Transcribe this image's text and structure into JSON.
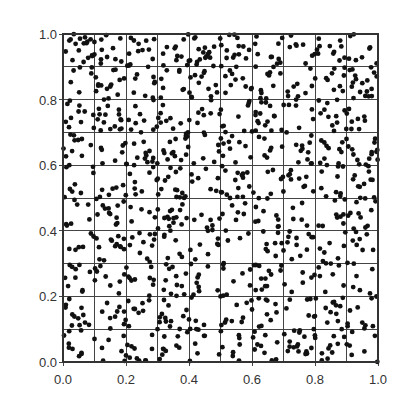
{
  "chart_data": {
    "type": "scatter",
    "title": "",
    "xlabel": "",
    "ylabel": "",
    "xlim": [
      0.0,
      1.0
    ],
    "ylim": [
      0.0,
      1.0
    ],
    "x_ticks": [
      "0.0",
      "0.2",
      "0.4",
      "0.6",
      "0.8",
      "1.0"
    ],
    "y_ticks": [
      "0.0",
      "0.2",
      "0.4",
      "0.6",
      "0.8",
      "1.0"
    ],
    "grid": true,
    "grid_divisions": 10,
    "legend": null,
    "approx_point_count": 1000,
    "marker_color": "#111111",
    "series": [
      {
        "name": "points",
        "points_note": "representative sample of the ~1000 uniformly scattered points",
        "x": [
          0.02,
          0.04,
          0.05,
          0.03,
          0.07,
          0.09,
          0.12,
          0.14,
          0.16,
          0.15,
          0.18,
          0.13,
          0.21,
          0.24,
          0.27,
          0.29,
          0.33,
          0.36,
          0.38,
          0.42,
          0.44,
          0.47,
          0.52,
          0.55,
          0.58,
          0.61,
          0.63,
          0.66,
          0.69,
          0.72,
          0.74,
          0.77,
          0.81,
          0.84,
          0.86,
          0.88,
          0.91,
          0.93,
          0.95,
          0.97,
          0.02,
          0.06,
          0.11,
          0.15,
          0.19,
          0.23,
          0.26,
          0.31,
          0.35,
          0.39,
          0.43,
          0.48,
          0.51,
          0.56,
          0.59,
          0.64,
          0.67,
          0.71,
          0.76,
          0.79,
          0.83,
          0.87,
          0.9,
          0.94,
          0.98,
          0.01,
          0.05,
          0.08,
          0.13,
          0.17,
          0.22,
          0.25,
          0.28,
          0.34,
          0.37,
          0.41,
          0.46,
          0.49,
          0.53,
          0.57,
          0.62,
          0.65,
          0.7,
          0.73,
          0.78,
          0.82,
          0.85,
          0.89,
          0.92,
          0.96,
          0.03,
          0.07,
          0.1,
          0.14,
          0.2,
          0.24,
          0.3,
          0.32,
          0.36,
          0.4,
          0.45,
          0.5,
          0.54,
          0.6,
          0.63,
          0.68,
          0.72,
          0.75,
          0.8,
          0.84,
          0.88,
          0.91,
          0.95,
          0.99
        ],
        "y": [
          0.98,
          0.97,
          0.95,
          0.92,
          0.99,
          0.88,
          0.91,
          0.93,
          0.89,
          0.84,
          0.86,
          0.8,
          0.94,
          0.97,
          0.9,
          0.85,
          0.96,
          0.92,
          0.83,
          0.99,
          0.87,
          0.81,
          0.95,
          0.9,
          0.84,
          0.97,
          0.82,
          0.93,
          0.88,
          0.96,
          0.8,
          0.91,
          0.94,
          0.86,
          0.83,
          0.98,
          0.89,
          0.92,
          0.85,
          0.81,
          0.6,
          0.68,
          0.74,
          0.71,
          0.66,
          0.78,
          0.62,
          0.73,
          0.64,
          0.69,
          0.76,
          0.61,
          0.72,
          0.67,
          0.79,
          0.63,
          0.75,
          0.7,
          0.65,
          0.77,
          0.62,
          0.73,
          0.68,
          0.71,
          0.64,
          0.42,
          0.35,
          0.48,
          0.31,
          0.44,
          0.38,
          0.52,
          0.29,
          0.46,
          0.33,
          0.55,
          0.4,
          0.36,
          0.5,
          0.27,
          0.43,
          0.58,
          0.34,
          0.47,
          0.39,
          0.53,
          0.3,
          0.45,
          0.37,
          0.41,
          0.04,
          0.12,
          0.07,
          0.18,
          0.02,
          0.15,
          0.1,
          0.22,
          0.05,
          0.13,
          0.08,
          0.2,
          0.03,
          0.16,
          0.11,
          0.06,
          0.19,
          0.09,
          0.14,
          0.01,
          0.17,
          0.05,
          0.12,
          0.08
        ]
      }
    ]
  }
}
